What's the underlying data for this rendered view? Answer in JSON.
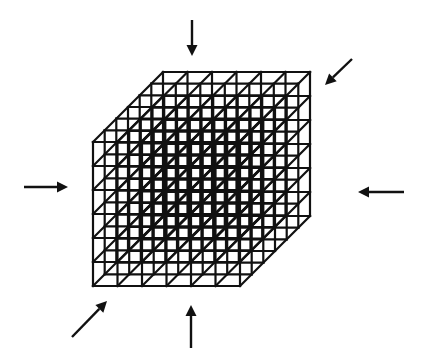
{
  "diagram": {
    "stroke_color": "#111111",
    "background": "#ffffff",
    "lattice": {
      "divisions": 6,
      "front_face": {
        "x0": 93,
        "y0": 142,
        "x1": 240,
        "y1": 286
      },
      "depth_offset": {
        "dx": 70,
        "dy": -70
      }
    },
    "arrows": [
      {
        "name": "arrow-top",
        "from": [
          192,
          20
        ],
        "to": [
          192,
          56
        ],
        "direction": "down"
      },
      {
        "name": "arrow-top-right",
        "from": [
          352,
          59
        ],
        "to": [
          325,
          85
        ],
        "direction": "down-left"
      },
      {
        "name": "arrow-left",
        "from": [
          24,
          187
        ],
        "to": [
          68,
          187
        ],
        "direction": "right"
      },
      {
        "name": "arrow-right",
        "from": [
          404,
          192
        ],
        "to": [
          358,
          192
        ],
        "direction": "left"
      },
      {
        "name": "arrow-bottom-left",
        "from": [
          72,
          337
        ],
        "to": [
          107,
          301
        ],
        "direction": "up-right"
      },
      {
        "name": "arrow-bottom",
        "from": [
          191,
          348
        ],
        "to": [
          191,
          305
        ],
        "direction": "up"
      }
    ]
  }
}
